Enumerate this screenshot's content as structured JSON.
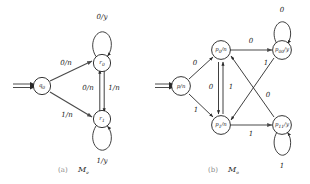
{
  "figure": {
    "background_color": "#ffffff",
    "stroke_color": "#2a2a2a",
    "edge_color": "#4a4a4a"
  },
  "diagrams": [
    {
      "id": "machine-a",
      "caption_paren": "(a)",
      "caption_name": "M",
      "caption_sub": "e",
      "states": [
        {
          "id": "q0",
          "base": "q",
          "sub": "0",
          "output": "",
          "label": "q0",
          "initial": true
        },
        {
          "id": "r0",
          "base": "r",
          "sub": "0",
          "output": "",
          "label": "r0",
          "initial": false
        },
        {
          "id": "r1",
          "base": "r",
          "sub": "1",
          "output": "",
          "label": "r1",
          "initial": false
        }
      ],
      "transitions": [
        {
          "from": "q0",
          "to": "r0",
          "label": "0/n"
        },
        {
          "from": "q0",
          "to": "r1",
          "label": "1/n"
        },
        {
          "from": "r1",
          "to": "r0",
          "label": "0/n"
        },
        {
          "from": "r0",
          "to": "r1",
          "label": "1/n"
        },
        {
          "from": "r0",
          "to": "r0",
          "label": "0/y",
          "self_loop": true
        },
        {
          "from": "r1",
          "to": "r1",
          "label": "1/y",
          "self_loop": true
        }
      ]
    },
    {
      "id": "machine-b",
      "caption_paren": "(b)",
      "caption_name": "M",
      "caption_sub": "o",
      "states": [
        {
          "id": "p",
          "base": "p",
          "sub": "",
          "output": "n",
          "label": "p/n",
          "initial": true
        },
        {
          "id": "p0",
          "base": "p",
          "sub": "0",
          "output": "n",
          "label": "p0/n",
          "initial": false
        },
        {
          "id": "p1",
          "base": "p",
          "sub": "1",
          "output": "n",
          "label": "p1/n",
          "initial": false
        },
        {
          "id": "p00",
          "base": "p",
          "sub": "00",
          "output": "y",
          "label": "p00/y",
          "initial": false
        },
        {
          "id": "p11",
          "base": "p",
          "sub": "11",
          "output": "y",
          "label": "p11/y",
          "initial": false
        }
      ],
      "transitions": [
        {
          "from": "p",
          "to": "p0",
          "label": "0"
        },
        {
          "from": "p",
          "to": "p1",
          "label": "1"
        },
        {
          "from": "p0",
          "to": "p1",
          "label": "0"
        },
        {
          "from": "p1",
          "to": "p0",
          "label": "1"
        },
        {
          "from": "p0",
          "to": "p00",
          "label": "0"
        },
        {
          "from": "p1",
          "to": "p11",
          "label": "1"
        },
        {
          "from": "p00",
          "to": "p1",
          "label": "1"
        },
        {
          "from": "p11",
          "to": "p0",
          "label": "0"
        },
        {
          "from": "p00",
          "to": "p00",
          "label": "0",
          "self_loop": true
        },
        {
          "from": "p11",
          "to": "p11",
          "label": "1",
          "self_loop": true
        }
      ]
    }
  ]
}
